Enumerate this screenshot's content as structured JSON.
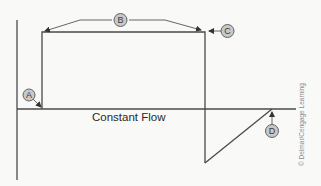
{
  "diagram": {
    "title": "Constant Flow",
    "colors": {
      "line": "#4a4a4a",
      "callout_fill": "#c8c8c8",
      "callout_stroke": "#555555",
      "background": "#f9f9f8",
      "copyright_text": "#8a8a8a"
    },
    "callouts": [
      {
        "id": "A",
        "label": "A"
      },
      {
        "id": "B",
        "label": "B"
      },
      {
        "id": "C",
        "label": "C"
      },
      {
        "id": "D",
        "label": "D"
      }
    ],
    "baseline_label": "Constant Flow",
    "copyright": "© Delmar/Cengage Learning"
  }
}
